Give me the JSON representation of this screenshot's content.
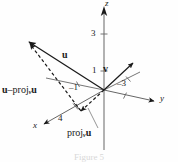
{
  "figure": {
    "caption": "Figure 5",
    "type": "3d-vector-projection-diagram",
    "axes": {
      "x": {
        "label": "x"
      },
      "y": {
        "label": "y"
      },
      "z": {
        "label": "z"
      }
    },
    "ticks": {
      "z3": "3",
      "z1": "1",
      "x_neg1": "–1",
      "y_neg3": "–3",
      "x4": "4"
    },
    "vectors": {
      "u": "u",
      "v": "v"
    },
    "labels": {
      "proj_prefix": "proj",
      "proj_subscript": "v",
      "proj_vector": "u",
      "difference_lead": "u",
      "difference_minus": "–"
    },
    "colors": {
      "ink": "#1a1a1a",
      "axis": "#555555",
      "background": "#fefefe",
      "caption": "#d8d8d8"
    }
  }
}
